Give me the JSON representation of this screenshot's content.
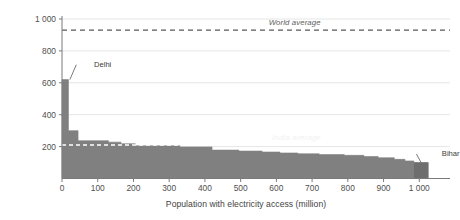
{
  "chart_data": {
    "type": "area",
    "title": "",
    "subtitle": "",
    "xlabel": "Population with electricity access (million)",
    "ylabel": "kWh per capita with access",
    "xlim": [
      0,
      1030
    ],
    "ylim": [
      0,
      1000
    ],
    "grid": true,
    "legend": "none",
    "x_ticks": [
      0,
      100,
      200,
      300,
      400,
      500,
      600,
      700,
      800,
      900,
      1000
    ],
    "x_tick_labels": [
      "0",
      "100",
      "200",
      "300",
      "400",
      "500",
      "600",
      "700",
      "800",
      "900",
      "1 000"
    ],
    "y_ticks": [
      200,
      400,
      600,
      800,
      1000
    ],
    "y_tick_labels": [
      "200",
      "400",
      "600",
      "800",
      "1 000"
    ],
    "series_name": "kWh per capita with access",
    "series_color": "#808080",
    "steps": [
      {
        "x_start": 0,
        "x_end": 18,
        "value": 620
      },
      {
        "x_start": 18,
        "x_end": 45,
        "value": 300
      },
      {
        "x_start": 45,
        "x_end": 130,
        "value": 237
      },
      {
        "x_start": 130,
        "x_end": 165,
        "value": 228
      },
      {
        "x_start": 165,
        "x_end": 205,
        "value": 218
      },
      {
        "x_start": 205,
        "x_end": 330,
        "value": 205
      },
      {
        "x_start": 330,
        "x_end": 420,
        "value": 198
      },
      {
        "x_start": 420,
        "x_end": 495,
        "value": 178
      },
      {
        "x_start": 495,
        "x_end": 560,
        "value": 172
      },
      {
        "x_start": 560,
        "x_end": 610,
        "value": 166
      },
      {
        "x_start": 610,
        "x_end": 660,
        "value": 160
      },
      {
        "x_start": 660,
        "x_end": 720,
        "value": 155
      },
      {
        "x_start": 720,
        "x_end": 790,
        "value": 150
      },
      {
        "x_start": 790,
        "x_end": 845,
        "value": 145
      },
      {
        "x_start": 845,
        "x_end": 885,
        "value": 138
      },
      {
        "x_start": 885,
        "x_end": 930,
        "value": 130
      },
      {
        "x_start": 930,
        "x_end": 960,
        "value": 120
      },
      {
        "x_start": 960,
        "x_end": 985,
        "value": 110
      },
      {
        "x_start": 985,
        "x_end": 1025,
        "value": 100
      }
    ],
    "reference_lines": [
      {
        "name": "world-average",
        "label": "World average",
        "value": 930,
        "style": "dashed",
        "color": "#595959",
        "label_x": 640,
        "label_position": "above"
      },
      {
        "name": "india-average",
        "label": "India average",
        "value": 210,
        "style": "dashed",
        "color": "#ffffff",
        "label_x": 650,
        "label_position": "above"
      }
    ],
    "annotations": [
      {
        "name": "delhi",
        "label": "Delhi",
        "x": 22,
        "value": 620,
        "label_x": 0,
        "label_y": 745,
        "color": "#595959"
      },
      {
        "name": "bihar",
        "label": "Bihar",
        "x": 1005,
        "value": 100,
        "label_x": 940,
        "label_y": 185,
        "color": "#595959"
      }
    ],
    "axis_color": "#7a7a7a",
    "grid_color": "#e6e6e6",
    "background": "#ffffff"
  }
}
